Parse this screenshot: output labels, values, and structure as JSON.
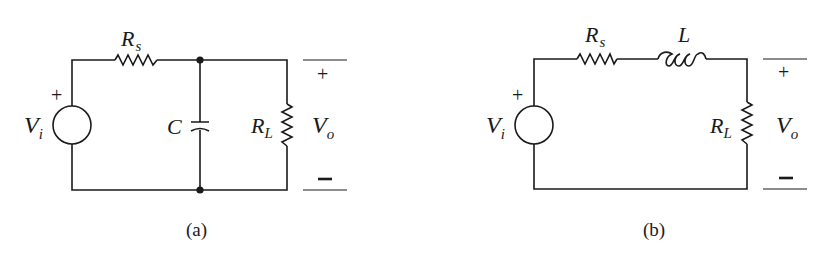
{
  "figure": {
    "circuit_a": {
      "caption": "(a)",
      "source": {
        "label": "V",
        "subscript": "i",
        "polarity": "+"
      },
      "series_resistor": {
        "label": "R",
        "subscript": "s"
      },
      "shunt_capacitor": {
        "label": "C"
      },
      "load_resistor": {
        "label": "R",
        "subscript": "L"
      },
      "output": {
        "label": "V",
        "subscript": "o",
        "plus": "+",
        "minus": "−"
      }
    },
    "circuit_b": {
      "caption": "(b)",
      "source": {
        "label": "V",
        "subscript": "i",
        "polarity": "+"
      },
      "series_resistor": {
        "label": "R",
        "subscript": "s"
      },
      "series_inductor": {
        "label": "L"
      },
      "load_resistor": {
        "label": "R",
        "subscript": "L"
      },
      "output": {
        "label": "V",
        "subscript": "o",
        "plus": "+",
        "minus": "−"
      }
    }
  }
}
